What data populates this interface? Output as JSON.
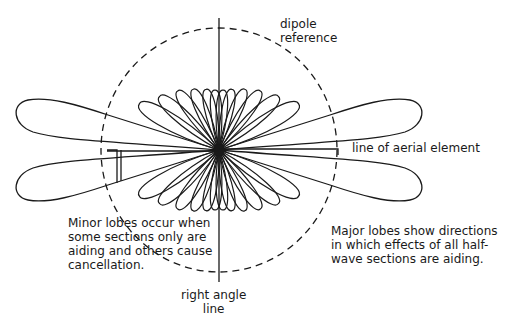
{
  "diagram": {
    "center": {
      "x": 219,
      "y": 150
    },
    "colors": {
      "line": "#1a1a1a",
      "background": "#ffffff"
    },
    "labels": {
      "dipole_reference": [
        "dipole",
        "reference"
      ],
      "line_of_aerial_element": "line of aerial element",
      "minor_lobes_note": [
        "Minor lobes occur when",
        "some sections only are",
        "aiding and others cause",
        "cancellation."
      ],
      "major_lobes_note": [
        "Major lobes show directions",
        "in which effects of all half-",
        "wave sections are aiding."
      ],
      "right_angle_line": [
        "right angle",
        "line"
      ]
    },
    "elements": {
      "dipole_reference_circle": {
        "style": "dashed",
        "rx": 118,
        "ry": 122
      },
      "right_angle_line": {
        "orientation": "vertical",
        "y_start": 18,
        "y_end": 282
      },
      "major_lobes": 4,
      "minor_lobes_per_quadrant": 6
    }
  }
}
